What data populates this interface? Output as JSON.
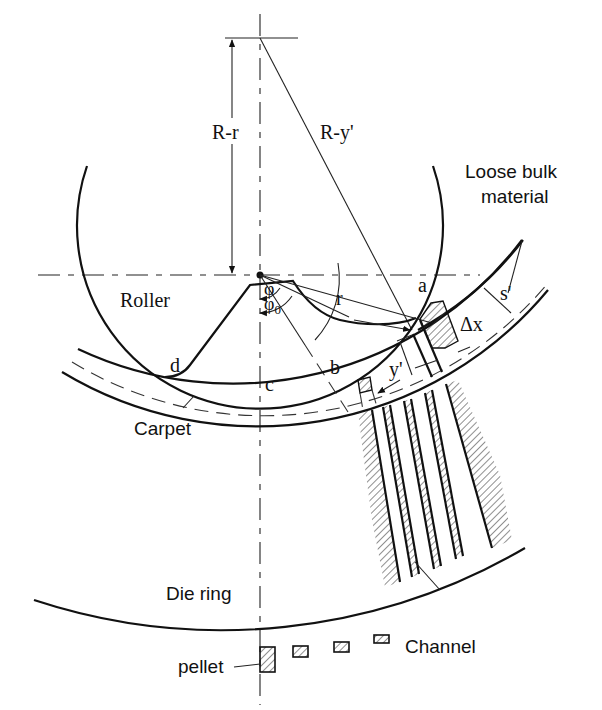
{
  "figure": {
    "labels": {
      "R_minus_r": "R-r",
      "R_minus_y_prime": "R-y'",
      "loose_bulk_line1": "Loose bulk",
      "loose_bulk_line2": "material",
      "roller": "Roller",
      "phi": "φ",
      "phi0": "φ",
      "phi0_sub": "0",
      "r": "r",
      "a": "a",
      "b": "b",
      "c": "c",
      "d": "d",
      "s_prime": "s'",
      "delta_x": "Δx",
      "y_prime": "y'",
      "carpet": "Carpet",
      "die_ring": "Die ring",
      "pellet": "pellet",
      "channel": "Channel"
    },
    "channel_count": 4,
    "pellet_count": 4
  }
}
